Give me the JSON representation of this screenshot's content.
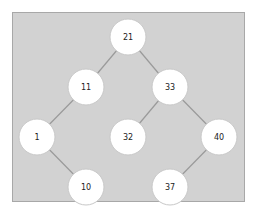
{
  "diagram": {
    "type": "binary-search-tree",
    "colors": {
      "panel_background": "#d2d2d2",
      "panel_border": "#a8a8a8",
      "edge": "#9a9a9a",
      "node_fill": "#ffffff",
      "node_stroke": "#c8c8c8",
      "label": "#222222"
    },
    "node_radius": 18,
    "nodes": [
      {
        "id": "n21",
        "label": "21",
        "x": 128,
        "y": 37
      },
      {
        "id": "n11",
        "label": "11",
        "x": 86,
        "y": 87
      },
      {
        "id": "n33",
        "label": "33",
        "x": 170,
        "y": 87
      },
      {
        "id": "n1",
        "label": "1",
        "x": 37,
        "y": 137
      },
      {
        "id": "n32",
        "label": "32",
        "x": 128,
        "y": 137
      },
      {
        "id": "n40",
        "label": "40",
        "x": 219,
        "y": 137
      },
      {
        "id": "n10",
        "label": "10",
        "x": 86,
        "y": 187
      },
      {
        "id": "n37",
        "label": "37",
        "x": 170,
        "y": 187
      }
    ],
    "edges": [
      {
        "from": "n21",
        "to": "n11"
      },
      {
        "from": "n21",
        "to": "n33"
      },
      {
        "from": "n11",
        "to": "n1"
      },
      {
        "from": "n33",
        "to": "n32"
      },
      {
        "from": "n33",
        "to": "n40"
      },
      {
        "from": "n1",
        "to": "n10"
      },
      {
        "from": "n40",
        "to": "n37"
      }
    ]
  }
}
